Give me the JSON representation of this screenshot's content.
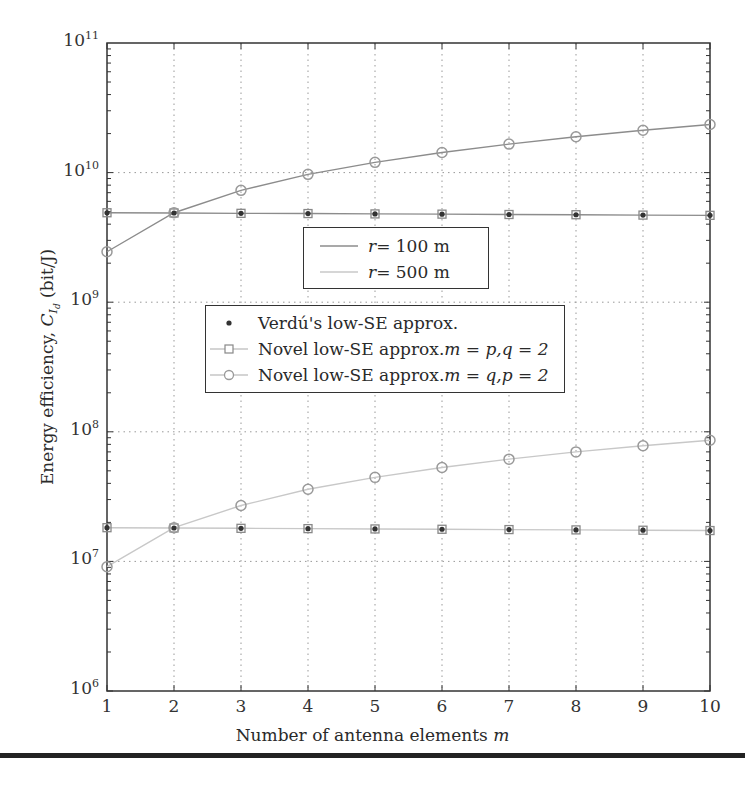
{
  "chart_data": {
    "type": "line",
    "title": "",
    "xlabel": "Number of antenna elements m",
    "ylabel": "Energy efficiency, C_{I_d} (bit/J)",
    "xlim": [
      1,
      10
    ],
    "ylim": [
      1000000.0,
      100000000000.0
    ],
    "yscale": "log",
    "grid": true,
    "x": [
      1,
      2,
      3,
      4,
      5,
      6,
      7,
      8,
      9,
      10
    ],
    "xtick_labels": [
      "1",
      "2",
      "3",
      "4",
      "5",
      "6",
      "7",
      "8",
      "9",
      "10"
    ],
    "ytick_labels": [
      "10^6",
      "10^7",
      "10^8",
      "10^9",
      "10^10",
      "10^11"
    ],
    "series": [
      {
        "name": "r = 100 m, Novel low-SE approx. m = p, q = 2",
        "line": "r = 100 m",
        "marker": "square",
        "values": [
          4900000000.0,
          4880000000.0,
          4850000000.0,
          4830000000.0,
          4800000000.0,
          4780000000.0,
          4750000000.0,
          4730000000.0,
          4700000000.0,
          4680000000.0
        ]
      },
      {
        "name": "r = 100 m, Novel low-SE approx. m = q, p = 2",
        "line": "r = 100 m",
        "marker": "circle",
        "values": [
          2450000000.0,
          4900000000.0,
          7300000000.0,
          9700000000.0,
          12000000000.0,
          14300000000.0,
          16600000000.0,
          18900000000.0,
          21200000000.0,
          23500000000.0
        ]
      },
      {
        "name": "r = 500 m, Novel low-SE approx. m = p, q = 2",
        "line": "r = 500 m",
        "marker": "square",
        "values": [
          18200000.0,
          18100000.0,
          18000000.0,
          17900000.0,
          17800000.0,
          17700000.0,
          17600000.0,
          17500000.0,
          17400000.0,
          17300000.0
        ]
      },
      {
        "name": "r = 500 m, Novel low-SE approx. m = q, p = 2",
        "line": "r = 500 m",
        "marker": "circle",
        "values": [
          9100000.0,
          18200000.0,
          27000000.0,
          36000000.0,
          44500000.0,
          53000000.0,
          61500000.0,
          70000000.0,
          78000000.0,
          86000000.0
        ]
      },
      {
        "name": "Verdú's low-SE approx. (r = 100 m)",
        "marker": "dot",
        "values": [
          4900000000.0,
          4880000000.0,
          4850000000.0,
          4830000000.0,
          4800000000.0,
          4780000000.0,
          4750000000.0,
          4730000000.0,
          4700000000.0,
          4680000000.0
        ]
      },
      {
        "name": "Verdú's low-SE approx. (r = 500 m)",
        "marker": "dot",
        "values": [
          18200000.0,
          18100000.0,
          18000000.0,
          17900000.0,
          17800000.0,
          17700000.0,
          17600000.0,
          17500000.0,
          17400000.0,
          17300000.0
        ]
      }
    ],
    "legend": {
      "box1": [
        {
          "label_var": "r",
          "label_rest": " = 100 m",
          "color": "#8c8c8c"
        },
        {
          "label_var": "r",
          "label_rest": " = 500 m",
          "color": "#c8c8c8"
        }
      ],
      "box2": [
        {
          "label": "Verdú's low-SE approx.",
          "suffix_a": "",
          "suffix_b": "",
          "marker": "dot"
        },
        {
          "label": "Novel low-SE approx. ",
          "suffix_a": "m = p, ",
          "suffix_b": "q = 2",
          "marker": "square"
        },
        {
          "label": "Novel low-SE approx. ",
          "suffix_a": "m = q, ",
          "suffix_b": "p = 2",
          "marker": "circle"
        }
      ]
    },
    "colors": {
      "r100": "#8c8c8c",
      "r500": "#c8c8c8",
      "axis": "#333333",
      "grid": "#999999"
    }
  },
  "axes": {
    "xlabel_text": "Number of antenna elements ",
    "xlabel_var": "m",
    "ylabel_text": "Energy efficiency, ",
    "ylabel_var": "C",
    "ylabel_sub": "I",
    "ylabel_subsub": "d",
    "ylabel_unit": " (bit/J)"
  }
}
